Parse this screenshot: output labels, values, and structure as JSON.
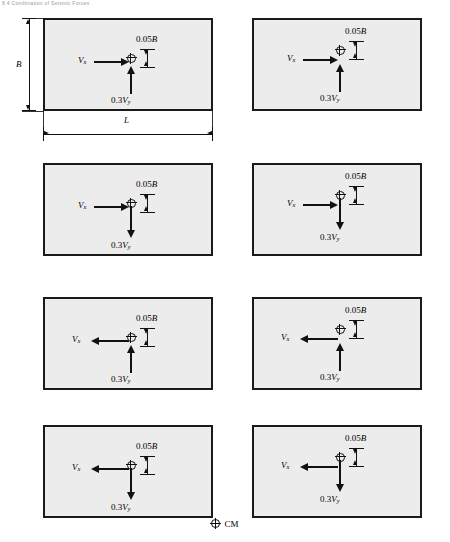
{
  "header": {
    "text": "8.4 Combination of Seismic Forces"
  },
  "labels": {
    "vx": "V",
    "vx_sub": "x",
    "vy_coeff": "0.3",
    "vy": "V",
    "vy_sub": "y",
    "ecc": "0.05",
    "ecc_dim": "B",
    "width_label": "B",
    "length_label": "L"
  },
  "legend": {
    "symbol_name": "cm-symbol",
    "text": "CM"
  },
  "chart_data": {
    "type": "diagram",
    "plan_width_label": "B",
    "plan_length_label": "L",
    "eccentricity": "0.05B",
    "orthogonal_factor": "0.3",
    "legend_symbol": "CM",
    "panel_count": 8,
    "panels": [
      {
        "id": 1,
        "row": 1,
        "col": 1,
        "vx_direction": "right",
        "vy_direction": "up",
        "vy_label": "0.3Vy",
        "vx_label": "Vx",
        "ecc_label": "0.05B",
        "cm_offset": "above",
        "has_dimensions": true
      },
      {
        "id": 2,
        "row": 1,
        "col": 2,
        "vx_direction": "right",
        "vy_direction": "up",
        "vy_label": "0.3Vy",
        "vx_label": "Vx",
        "ecc_label": "0.05B",
        "cm_offset": "below",
        "has_dimensions": false
      },
      {
        "id": 3,
        "row": 2,
        "col": 1,
        "vx_direction": "right",
        "vy_direction": "down",
        "vy_label": "0.3Vy",
        "vx_label": "Vx",
        "ecc_label": "0.05B",
        "cm_offset": "above",
        "has_dimensions": false
      },
      {
        "id": 4,
        "row": 2,
        "col": 2,
        "vx_direction": "right",
        "vy_direction": "down",
        "vy_label": "0.3Vy",
        "vx_label": "Vx",
        "ecc_label": "0.05B",
        "cm_offset": "below",
        "has_dimensions": false
      },
      {
        "id": 5,
        "row": 3,
        "col": 1,
        "vx_direction": "left",
        "vy_direction": "up",
        "vy_label": "0.3Vy",
        "vx_label": "Vx",
        "ecc_label": "0.05B",
        "cm_offset": "above",
        "has_dimensions": false
      },
      {
        "id": 6,
        "row": 3,
        "col": 2,
        "vx_direction": "left",
        "vy_direction": "up",
        "vy_label": "0.3Vy",
        "vx_label": "Vx",
        "ecc_label": "0.05B",
        "cm_offset": "below",
        "has_dimensions": false
      },
      {
        "id": 7,
        "row": 4,
        "col": 1,
        "vx_direction": "left",
        "vy_direction": "down",
        "vy_label": "0.3Vy",
        "vx_label": "Vx",
        "ecc_label": "0.05B",
        "cm_offset": "above",
        "has_dimensions": false
      },
      {
        "id": 8,
        "row": 4,
        "col": 2,
        "vx_direction": "left",
        "vy_direction": "down",
        "vy_label": "0.3Vy",
        "vx_label": "Vx",
        "ecc_label": "0.05B",
        "cm_offset": "below",
        "has_dimensions": false
      }
    ]
  }
}
